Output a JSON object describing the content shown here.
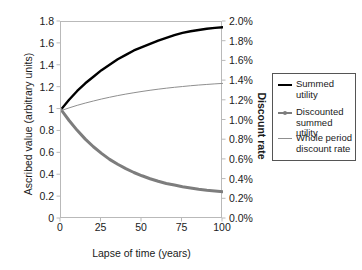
{
  "chart_data": {
    "type": "line",
    "title": "",
    "xlabel": "Lapse of time (years)",
    "ylabel": "Ascribed value (arbitrary units)",
    "ylabel_right": "Discount rate",
    "xlim": [
      0,
      100
    ],
    "ylim": [
      0,
      1.8
    ],
    "ylim_right": [
      0.0,
      2.0
    ],
    "grid": false,
    "legend_position": "right-outside",
    "xticks": [
      "0",
      "25",
      "50",
      "75",
      "100"
    ],
    "xtick_values": [
      0,
      25,
      50,
      75,
      100
    ],
    "yticks_left": [
      "0",
      "0.2",
      "0.4",
      "0.6",
      "0.8",
      "1",
      "1.2",
      "1.4",
      "1.6",
      "1.8"
    ],
    "ytick_values_left": [
      0,
      0.2,
      0.4,
      0.6,
      0.8,
      1.0,
      1.2,
      1.4,
      1.6,
      1.8
    ],
    "yticks_right": [
      "0.0%",
      "0.2%",
      "0.4%",
      "0.6%",
      "0.8%",
      "1.0%",
      "1.2%",
      "1.4%",
      "1.6%",
      "1.8%",
      "2.0%"
    ],
    "ytick_values_right": [
      0.0,
      0.2,
      0.4,
      0.6,
      0.8,
      1.0,
      1.2,
      1.4,
      1.6,
      1.8,
      2.0
    ],
    "x": [
      0,
      5,
      10,
      15,
      20,
      25,
      30,
      35,
      40,
      45,
      50,
      55,
      60,
      65,
      70,
      75,
      80,
      85,
      90,
      95,
      100
    ],
    "series": [
      {
        "name": "Summed utility",
        "axis": "left",
        "color": "#000000",
        "width": 2.4,
        "marker": "none",
        "values": [
          1.0,
          1.09,
          1.17,
          1.24,
          1.3,
          1.36,
          1.41,
          1.46,
          1.5,
          1.54,
          1.57,
          1.6,
          1.63,
          1.655,
          1.68,
          1.7,
          1.715,
          1.727,
          1.738,
          1.746,
          1.752
        ]
      },
      {
        "name": "Discounted summed utility",
        "axis": "left",
        "color": "#7d7d7d",
        "width": 3.0,
        "marker": "dot",
        "values": [
          1.0,
          0.9,
          0.81,
          0.73,
          0.66,
          0.6,
          0.545,
          0.5,
          0.46,
          0.425,
          0.395,
          0.368,
          0.345,
          0.325,
          0.31,
          0.295,
          0.283,
          0.272,
          0.263,
          0.256,
          0.25
        ]
      },
      {
        "name": "Whole period discount rate",
        "axis": "right",
        "color": "#8f8f8f",
        "width": 1.0,
        "marker": "none",
        "values": [
          1.1,
          1.128,
          1.154,
          1.177,
          1.198,
          1.218,
          1.236,
          1.253,
          1.268,
          1.282,
          1.295,
          1.307,
          1.318,
          1.328,
          1.337,
          1.345,
          1.353,
          1.36,
          1.366,
          1.372,
          1.377
        ]
      }
    ],
    "legend": [
      {
        "label": "Summed utility",
        "color": "#000000",
        "width": 2.4,
        "marker": "none"
      },
      {
        "label": "Discounted summed utility",
        "color": "#7d7d7d",
        "width": 2.0,
        "marker": "dot"
      },
      {
        "label": "Whole period discount rate",
        "color": "#8f8f8f",
        "width": 1.0,
        "marker": "none"
      }
    ]
  }
}
